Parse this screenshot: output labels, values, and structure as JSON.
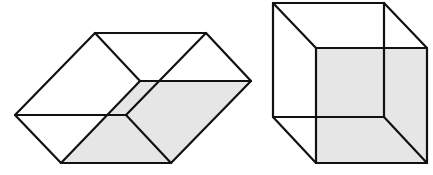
{
  "figures": [
    {
      "name": "flattened-necker-cube",
      "shaded_face": "bottom",
      "shade_color": "#e6e6e6",
      "line_color": "#111111"
    },
    {
      "name": "wireframe-necker-cube",
      "shaded_face": "front",
      "shade_color": "#e6e6e6",
      "line_color": "#111111"
    }
  ]
}
